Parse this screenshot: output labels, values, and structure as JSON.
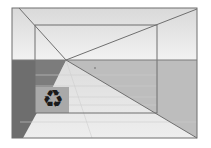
{
  "diagram": {
    "type": "perspective-room",
    "colors": {
      "background": "#ffffff",
      "ceiling": "#e4e4e4",
      "floor": "#e2e2e2",
      "back_wall_upper": "#e8e8e8",
      "right_wall_lower": "#bdbdbd",
      "left_wall_dark": "#6e6e6e",
      "left_wall_mid": "#8a8a8a",
      "icon_box": "#a9a9a9",
      "line": "#6f6f6f"
    },
    "icon": {
      "name": "recycle-icon",
      "glyph": "♻"
    }
  }
}
